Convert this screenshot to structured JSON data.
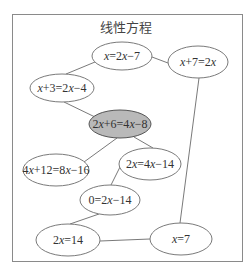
{
  "title": "线性方程",
  "colors": {
    "frame": "#8a8a8a",
    "node_fill": "#ffffff",
    "node_highlight_fill": "#b9b9b9",
    "edge": "#6a6a6a"
  },
  "nodes": [
    {
      "id": "n1",
      "label": "x=2x−7",
      "cx": 122,
      "cy": 56,
      "rx": 30,
      "ry": 14,
      "highlight": false
    },
    {
      "id": "n2",
      "label": "x+7=2x",
      "cx": 198,
      "cy": 62,
      "rx": 30,
      "ry": 16,
      "highlight": false
    },
    {
      "id": "n3",
      "label": "x+3=2x−4",
      "cx": 62,
      "cy": 88,
      "rx": 32,
      "ry": 14,
      "highlight": false
    },
    {
      "id": "n4",
      "label": "2x+6=4x−8",
      "cx": 120,
      "cy": 124,
      "rx": 31,
      "ry": 14,
      "highlight": true
    },
    {
      "id": "n5",
      "label": "4x+12=8x−16",
      "cx": 56,
      "cy": 170,
      "rx": 33,
      "ry": 16,
      "highlight": false
    },
    {
      "id": "n6",
      "label": "2x=4x−14",
      "cx": 150,
      "cy": 164,
      "rx": 31,
      "ry": 16,
      "highlight": false
    },
    {
      "id": "n7",
      "label": "0=2x−14",
      "cx": 110,
      "cy": 200,
      "rx": 30,
      "ry": 15,
      "highlight": false
    },
    {
      "id": "n8",
      "label": "2x=14",
      "cx": 68,
      "cy": 240,
      "rx": 32,
      "ry": 16,
      "highlight": false
    },
    {
      "id": "n9",
      "label": "x=7",
      "cx": 181,
      "cy": 239,
      "rx": 31,
      "ry": 16,
      "highlight": false
    }
  ],
  "edges": [
    {
      "from": "n1",
      "to": "n3",
      "x1": 95,
      "y1": 62,
      "x2": 66,
      "y2": 74
    },
    {
      "from": "n1",
      "to": "n2",
      "x1": 152,
      "y1": 57,
      "x2": 168,
      "y2": 63
    },
    {
      "from": "n3",
      "to": "n4",
      "x1": 64,
      "y1": 102,
      "x2": 95,
      "y2": 117
    },
    {
      "from": "n4",
      "to": "n5",
      "x1": 117,
      "y1": 138,
      "x2": 84,
      "y2": 162
    },
    {
      "from": "n4",
      "to": "n6",
      "x1": 134,
      "y1": 137,
      "x2": 153,
      "y2": 148
    },
    {
      "from": "n6",
      "to": "n7",
      "x1": 121,
      "y1": 165,
      "x2": 111,
      "y2": 185
    },
    {
      "from": "n7",
      "to": "n8",
      "x1": 99,
      "y1": 214,
      "x2": 70,
      "y2": 224
    },
    {
      "from": "n8",
      "to": "n9",
      "x1": 100,
      "y1": 241,
      "x2": 150,
      "y2": 239
    },
    {
      "from": "n2",
      "to": "n9",
      "x1": 199,
      "y1": 78,
      "x2": 180,
      "y2": 223
    }
  ]
}
